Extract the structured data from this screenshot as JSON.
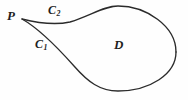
{
  "figure": {
    "name": "closed-curve-region-diagram",
    "background_color": "#fefefe",
    "stroke_color": "#2b2b2b",
    "width": 188,
    "height": 100
  },
  "labels": {
    "point_p": "P",
    "curve_upper_base": "C",
    "curve_upper_subscript": "2",
    "curve_lower_base": "C",
    "curve_lower_subscript": "1",
    "region": "D"
  },
  "chart_data": {
    "type": "diagram",
    "title": "",
    "elements": [
      {
        "name": "cusp-point-P",
        "label": "P",
        "x": 22,
        "y": 19
      },
      {
        "name": "upper-arc-C2",
        "label": "C2",
        "role": "upper boundary arc from P around the top-right of the loop",
        "path": "M 22 19 C 38 23, 56 25, 70 22 C 92 15, 104 6, 118 6 C 146 6, 176 26, 176 52",
        "label_x": 48,
        "label_y": 4
      },
      {
        "name": "lower-arc-C1",
        "label": "C1",
        "role": "lower boundary arc from P around the bottom of the loop back to the right side",
        "path": "M 22 19 C 38 28, 58 48, 74 66 C 88 82, 100 91, 118 91 C 150 91, 176 74, 176 52",
        "label_x": 35,
        "label_y": 38
      },
      {
        "name": "region-D",
        "label": "D",
        "role": "interior region enclosed by C1 and C2",
        "label_x": 114,
        "label_y": 38
      }
    ],
    "extents": {
      "leftmost_x": 22,
      "rightmost_x": 176,
      "topmost_y": 6,
      "bottommost_y": 91
    },
    "grid": false,
    "legend": "none"
  }
}
